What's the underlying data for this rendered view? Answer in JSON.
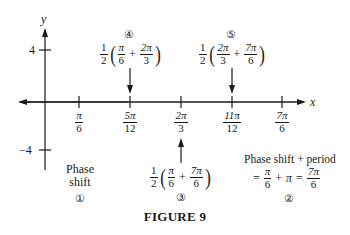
{
  "figure": {
    "caption": "FIGURE 9",
    "axes": {
      "x_label": "x",
      "y_label": "y",
      "y_ticks": [
        {
          "label": "4",
          "value": 4
        },
        {
          "label": "−4",
          "value": -4
        }
      ],
      "x_ticks": [
        {
          "num": "π",
          "den": "6",
          "value": "π/6"
        },
        {
          "num": "5π",
          "den": "12",
          "value": "5π/12"
        },
        {
          "num": "2π",
          "den": "3",
          "value": "2π/3"
        },
        {
          "num": "11π",
          "den": "12",
          "value": "11π/12"
        },
        {
          "num": "7π",
          "den": "6",
          "value": "7π/6"
        }
      ]
    },
    "annotations": {
      "step1": {
        "marker": "①",
        "line1": "Phase",
        "line2": "shift"
      },
      "step2": {
        "marker": "②",
        "line1": "Phase shift + period",
        "eq_prefix": "=",
        "a_num": "π",
        "a_den": "6",
        "plus": "+",
        "b": "π",
        "eq": "=",
        "c_num": "7π",
        "c_den": "6"
      },
      "step3": {
        "marker": "③",
        "coef_num": "1",
        "coef_den": "2",
        "a_num": "π",
        "a_den": "6",
        "plus": "+",
        "b_num": "7π",
        "b_den": "6"
      },
      "step4": {
        "marker": "④",
        "coef_num": "1",
        "coef_den": "2",
        "a_num": "π",
        "a_den": "6",
        "plus": "+",
        "b_num": "2π",
        "b_den": "3"
      },
      "step5": {
        "marker": "⑤",
        "coef_num": "1",
        "coef_den": "2",
        "a_num": "2π",
        "a_den": "3",
        "plus": "+",
        "b_num": "7π",
        "b_den": "6"
      }
    }
  }
}
